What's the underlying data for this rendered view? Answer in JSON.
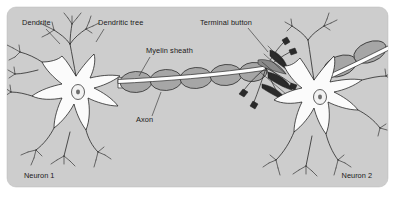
{
  "figure": {
    "panel": {
      "background_color": "#cdcdcd",
      "corner_radius": 9,
      "x": 7,
      "y": 7,
      "width": 381,
      "height": 180
    },
    "page_background_color": "#ffffff",
    "ink_color": "#1e1e1e",
    "myelin_color": "#a6a6a6",
    "soma_color": "#fbfbfb",
    "terminal_button_color": "#2a2a2a"
  },
  "labels": [
    {
      "id": "dendrite",
      "text": "Dendrite",
      "x": 22,
      "y": 25,
      "anchor": "start",
      "leader": "M 46 29 L 60 44"
    },
    {
      "id": "dendritic-tree",
      "text": "Dendritic tree",
      "x": 98,
      "y": 25,
      "anchor": "start",
      "leader": "M 104 29 L 96 42"
    },
    {
      "id": "myelin-sheath",
      "text": "Myelin sheath",
      "x": 146,
      "y": 53,
      "anchor": "start",
      "leader": "M 150 57 L 139 76"
    },
    {
      "id": "terminal-button",
      "text": "Terminal button",
      "x": 200,
      "y": 25,
      "anchor": "start",
      "leader": "M 248 28 L 268 52"
    },
    {
      "id": "axon",
      "text": "Axon",
      "x": 136,
      "y": 122,
      "anchor": "start",
      "leader": "M 152 116 L 161 92"
    }
  ],
  "corner_labels": [
    {
      "id": "neuron-1",
      "text": "Neuron 1",
      "x": 24,
      "y": 178,
      "anchor": "start"
    },
    {
      "id": "neuron-2",
      "text": "Neuron 2",
      "x": 372,
      "y": 178,
      "anchor": "end"
    }
  ],
  "structures": {
    "neuron_1": {
      "name": "Neuron 1",
      "soma_center": {
        "x": 82,
        "y": 90
      },
      "nucleus_center": {
        "x": 78,
        "y": 92
      },
      "dendrite_count": 6,
      "axon_direction": "right"
    },
    "neuron_2": {
      "name": "Neuron 2",
      "soma_center": {
        "x": 318,
        "y": 95
      },
      "nucleus_center": {
        "x": 320,
        "y": 97
      },
      "dendrite_count": 6,
      "axon_direction": "upper-right"
    },
    "myelin_segments": 7,
    "synapse_location": {
      "x": 272,
      "y": 78
    }
  }
}
